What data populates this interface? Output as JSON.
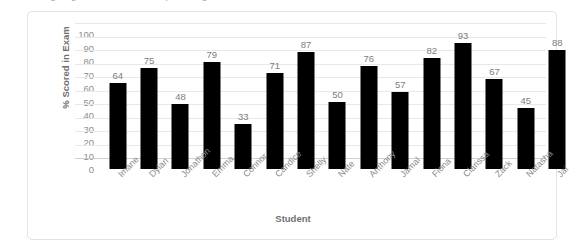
{
  "page": {
    "clipped_top_text": "the following diagram shows the exam percentages"
  },
  "chart": {
    "y_axis_title": "% Scored in Exam",
    "x_axis_title": "Student"
  },
  "chart_data": {
    "type": "bar",
    "title": "",
    "xlabel": "Student",
    "ylabel": "% Scored in Exam",
    "ylim": [
      0,
      100
    ],
    "yticks": [
      0,
      10,
      20,
      30,
      40,
      50,
      60,
      70,
      80,
      90,
      100
    ],
    "grid": true,
    "legend": "none",
    "bar_color": "#000000",
    "categories": [
      "Imane",
      "Dylan",
      "Jonathon",
      "Emma",
      "Connor",
      "Candice",
      "Shelly",
      "Nate",
      "Anthony",
      "Jamal",
      "Fiona",
      "Clarissa",
      "Zack",
      "Natasha",
      "Jai"
    ],
    "values": [
      64,
      75,
      48,
      79,
      33,
      71,
      87,
      50,
      76,
      57,
      82,
      93,
      67,
      45,
      88
    ]
  }
}
